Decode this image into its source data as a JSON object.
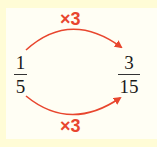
{
  "diagram": {
    "left_fraction": {
      "numerator": "1",
      "denominator": "5"
    },
    "right_fraction": {
      "numerator": "3",
      "denominator": "15"
    },
    "top_label": "×3",
    "bottom_label": "×3",
    "arrow_color": "#e8462e",
    "background_color": "#fffcd6"
  }
}
